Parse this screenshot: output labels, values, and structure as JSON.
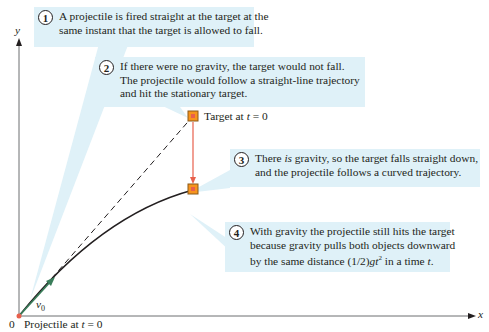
{
  "callouts": [
    {
      "number": "1",
      "lines": [
        "A projectile is fired straight at the target at the",
        "same instant that the target is allowed to fall."
      ]
    },
    {
      "number": "2",
      "lines": [
        "If there were no gravity, the target would not fall.",
        "The projectile would follow a straight-line trajectory",
        "and hit the stationary target."
      ]
    },
    {
      "number": "3",
      "pre": "There ",
      "em": "is",
      "post": " gravity, so the target falls straight down,",
      "line2": "and the projectile follows a curved trajectory."
    },
    {
      "number": "4",
      "lines": [
        "With gravity the projectile still hits the target",
        "because gravity pulls both objects downward"
      ],
      "line3_pre": "by the same distance (1/2)",
      "line3_g": "gt",
      "line3_sup": "2",
      "line3_mid": " in a time ",
      "line3_t": "t",
      "line3_end": "."
    }
  ],
  "labels": {
    "target_pre": "Target at ",
    "target_t": "t",
    "target_post": " = 0",
    "projectile_pre": "Projectile at ",
    "projectile_t": "t",
    "projectile_post": " = 0",
    "origin": "0",
    "y_axis": "y",
    "x_axis": "x",
    "velocity": "v",
    "velocity_sub": "0"
  },
  "colors": {
    "callout_bg": "#dff1f8",
    "target_fill": "#f7941d",
    "fall_arrow": "#e8604c",
    "velocity_arrow": "#3a7d5a",
    "axis": "#6d6e71",
    "trajectory": "#231f20"
  }
}
